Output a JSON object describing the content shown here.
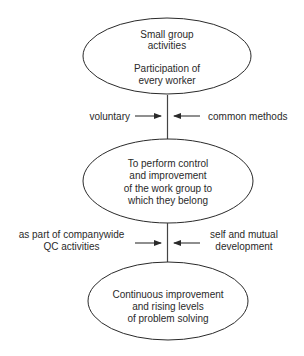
{
  "diagram": {
    "nodes": [
      {
        "id": "small-group",
        "lines": [
          "Small group",
          "activities",
          "",
          "Participation of",
          "every worker"
        ]
      },
      {
        "id": "control-improvement",
        "lines": [
          "To perform control",
          "and improvement",
          "of the work group to",
          "which they belong"
        ]
      },
      {
        "id": "continuous-improvement",
        "lines": [
          "Continuous improvement",
          "and rising levels",
          "of problem solving"
        ]
      }
    ],
    "connector_1": {
      "left_label": [
        "voluntary"
      ],
      "right_label": [
        "common methods"
      ]
    },
    "connector_2": {
      "left_label": [
        "as part of companywide",
        "QC activities"
      ],
      "right_label": [
        "self and mutual",
        "development"
      ]
    }
  },
  "colors": {
    "stroke": "#2a2a2a",
    "text": "#2a2a2a",
    "background": "#ffffff"
  }
}
